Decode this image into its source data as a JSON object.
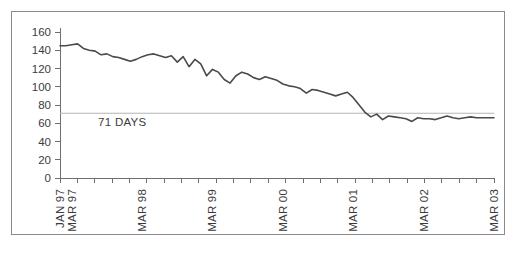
{
  "chart_data": {
    "type": "line",
    "title": "",
    "subtitle": "",
    "xlabel": "",
    "ylabel": "",
    "ylim": [
      0,
      160
    ],
    "yticks": [
      0,
      20,
      40,
      60,
      80,
      100,
      120,
      140,
      160
    ],
    "ytick_labels": [
      "0",
      "20",
      "40",
      "60",
      "80",
      "100",
      "120",
      "140",
      "160"
    ],
    "grid": false,
    "legend_position": "none",
    "xtick_labels": [
      "JAN 97",
      "MAR 97",
      "MAR 98",
      "MAR 99",
      "MAR 00",
      "MAR 01",
      "MAR 02",
      "MAR 03"
    ],
    "xtick_label_rotation": 90,
    "x_minor_tick_count": 26,
    "annotations": [
      {
        "name": "reference-line-label",
        "text": "71 DAYS",
        "value": 71
      }
    ],
    "reference_line": {
      "label": "71 DAYS",
      "value": 71,
      "color": "#b4b4b4"
    },
    "series": [
      {
        "name": "days",
        "color": "#4a4a4a",
        "x": [
          "JAN 97",
          "FEB 97",
          "MAR 97",
          "APR 97",
          "MAY 97",
          "JUN 97",
          "JUL 97",
          "AUG 97",
          "SEP 97",
          "OCT 97",
          "NOV 97",
          "DEC 97",
          "JAN 98",
          "FEB 98",
          "MAR 98",
          "APR 98",
          "MAY 98",
          "JUN 98",
          "JUL 98",
          "AUG 98",
          "SEP 98",
          "OCT 98",
          "NOV 98",
          "DEC 98",
          "JAN 99",
          "FEB 99",
          "MAR 99",
          "APR 99",
          "MAY 99",
          "JUN 99",
          "JUL 99",
          "AUG 99",
          "SEP 99",
          "OCT 99",
          "NOV 99",
          "DEC 99",
          "JAN 00",
          "FEB 00",
          "MAR 00",
          "APR 00",
          "MAY 00",
          "JUN 00",
          "JUL 00",
          "AUG 00",
          "SEP 00",
          "OCT 00",
          "NOV 00",
          "DEC 00",
          "JAN 01",
          "FEB 01",
          "MAR 01",
          "APR 01",
          "MAY 01",
          "JUN 01",
          "JUL 01",
          "AUG 01",
          "SEP 01",
          "OCT 01",
          "NOV 01",
          "DEC 01",
          "JAN 02",
          "FEB 02",
          "MAR 02",
          "APR 02",
          "MAY 02",
          "JUN 02",
          "JUL 02",
          "AUG 02",
          "SEP 02",
          "OCT 02",
          "NOV 02",
          "DEC 02",
          "JAN 03",
          "FEB 03",
          "MAR 03"
        ],
        "values": [
          145,
          145,
          146,
          147,
          142,
          140,
          139,
          135,
          136,
          133,
          132,
          130,
          128,
          130,
          133,
          135,
          136,
          134,
          132,
          134,
          127,
          133,
          122,
          130,
          125,
          112,
          119,
          116,
          108,
          104,
          112,
          116,
          114,
          110,
          108,
          111,
          109,
          107,
          103,
          101,
          100,
          98,
          93,
          97,
          96,
          94,
          92,
          90,
          92,
          94,
          88,
          80,
          72,
          67,
          70,
          64,
          68,
          67,
          66,
          65,
          62,
          66,
          65,
          65,
          64,
          66,
          68,
          66,
          65,
          66,
          67,
          66,
          66,
          66,
          66
        ]
      }
    ]
  }
}
